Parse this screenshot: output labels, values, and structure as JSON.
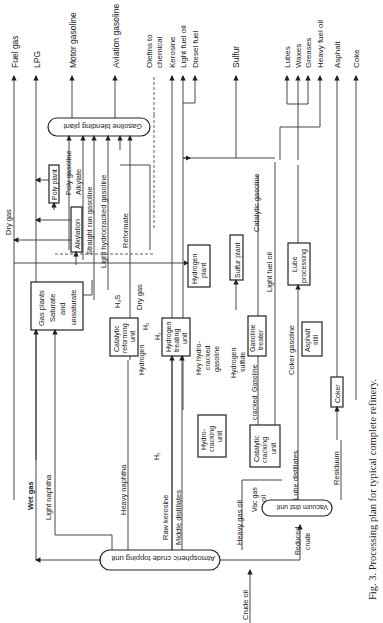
{
  "figure": {
    "caption": "Fig. 3.  Processing plan for typical complete refinery.",
    "orientation": "rotated-90-ccw"
  },
  "products": [
    {
      "label": "Fuel gas",
      "x": 14
    },
    {
      "label": "LPG",
      "x": 36
    },
    {
      "label": "Motor gasoline",
      "x": 72
    },
    {
      "label": "Aviation gasoline",
      "x": 115
    },
    {
      "label": "Olefins to chemical",
      "x": 155
    },
    {
      "label": "Kerosine",
      "x": 172
    },
    {
      "label": "Light fuel oil",
      "x": 183
    },
    {
      "label": "Diesel fuel",
      "x": 195
    },
    {
      "label": "Sulfur",
      "x": 236
    },
    {
      "label": "Lubes",
      "x": 287
    },
    {
      "label": "Waxes",
      "x": 298
    },
    {
      "label": "Greases",
      "x": 308
    },
    {
      "label": "Heavy fuel oil",
      "x": 320
    },
    {
      "label": "Asphalt",
      "x": 337
    },
    {
      "label": "Coke",
      "x": 356
    }
  ],
  "units": {
    "gasoline_blending": "Gasoline blending plant",
    "poly_plant": "Poly plant",
    "alkylation": "Alkylation",
    "gas_plants": [
      "Gas plants",
      "Saturate",
      "and",
      "unsaturate"
    ],
    "catalytic_reforming": [
      "Catalytic",
      "reforming",
      "unit"
    ],
    "hydrogen_treating": [
      "Hydrogen",
      "treating",
      "unit"
    ],
    "hydrogen_plant": [
      "Hydrogen",
      "plant"
    ],
    "sulfur_plant": "Sulfur plant",
    "lube_processing": [
      "Lube",
      "processing"
    ],
    "gasoline_treater": [
      "Gasoline",
      "treater"
    ],
    "asphalt_still": [
      "Asphalt",
      "still"
    ],
    "hydrocracking": [
      "Hydro-",
      "cracking",
      "unit"
    ],
    "catalytic_cracking": [
      "Catalytic",
      "cracking",
      "unit"
    ],
    "coker": "Coker",
    "vacuum_dist": "Vacuum dist unit",
    "atmospheric_topping": "Atmospheric crude topping unit"
  },
  "streams": {
    "dry_gas": "Dry gas",
    "poly_gasoline": "Poly gasoline",
    "alkylate": "Alkylate",
    "straight_run_gasoline": "Straight run gasoline",
    "light_hydrocracked_gasoline": "Light hydrocracked gasoline",
    "reformate": "Reformate",
    "h2s": "H₂S",
    "dry_gas_2": "Dry gas",
    "hydrogen": "Hydrogen",
    "h2_a": "H₂",
    "h2_b": "H₂",
    "h2_c": "H₂",
    "catalytic_gasoline": "Catalytic gasoline",
    "light_fuel_oil": "Light fuel oil",
    "hvy_hydrocracked_gasoline": [
      "Hvy hydro-",
      "cracked",
      "gasoline"
    ],
    "hydrogen_sulfide": [
      "Hydrogen",
      "sulfide"
    ],
    "cracked_gasoline": "Gasoline",
    "cracked": "cracked",
    "coker_gasoline": "Coker gasoline",
    "wet_gas": "Wet gas",
    "light_naphtha": "Light naphtha",
    "heavy_naphtha": "Heavy naphtha",
    "raw_kerosine": "Raw kerosine",
    "middle_distillates": "Middle distillates",
    "heavy_gas_oil": "Heavy gas oil",
    "vac_gas_oil": [
      "Vac gas",
      "oil"
    ],
    "lube_distillates": "Lube distillates",
    "residuum": "Residuum",
    "reduced_crude": [
      "Reduced",
      "crude"
    ],
    "crude_oil": "Crude oil"
  }
}
